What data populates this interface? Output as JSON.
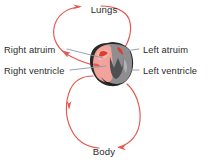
{
  "diagram": {
    "background_color": "#ffffff",
    "flow_color": "#e4584f",
    "flow_color_light": "#ec8a84",
    "leader_color": "#8d97a3",
    "text_color": "#2b2b2b",
    "nodes": {
      "lungs": "Lungs",
      "body": "Body"
    },
    "labels": {
      "right_atrium": "Right atruim",
      "right_ventricle": "Right ventricle",
      "left_atrium": "Left atruim",
      "left_ventricle": "Left ventricle"
    },
    "heart": {
      "name": "heart-illustration",
      "left_chamber_color": "#f2a39b",
      "right_chamber_color": "#8e8e90",
      "outline_color": "#2a2a2a",
      "accent_color": "#e03c2e"
    },
    "arrows": [
      {
        "name": "arrow-into-lungs",
        "direction": "right"
      },
      {
        "name": "arrow-down-left-pulmonary",
        "direction": "down-left"
      },
      {
        "name": "arrow-into-body",
        "direction": "left"
      },
      {
        "name": "arrow-up-left-systemic",
        "direction": "up"
      }
    ]
  }
}
